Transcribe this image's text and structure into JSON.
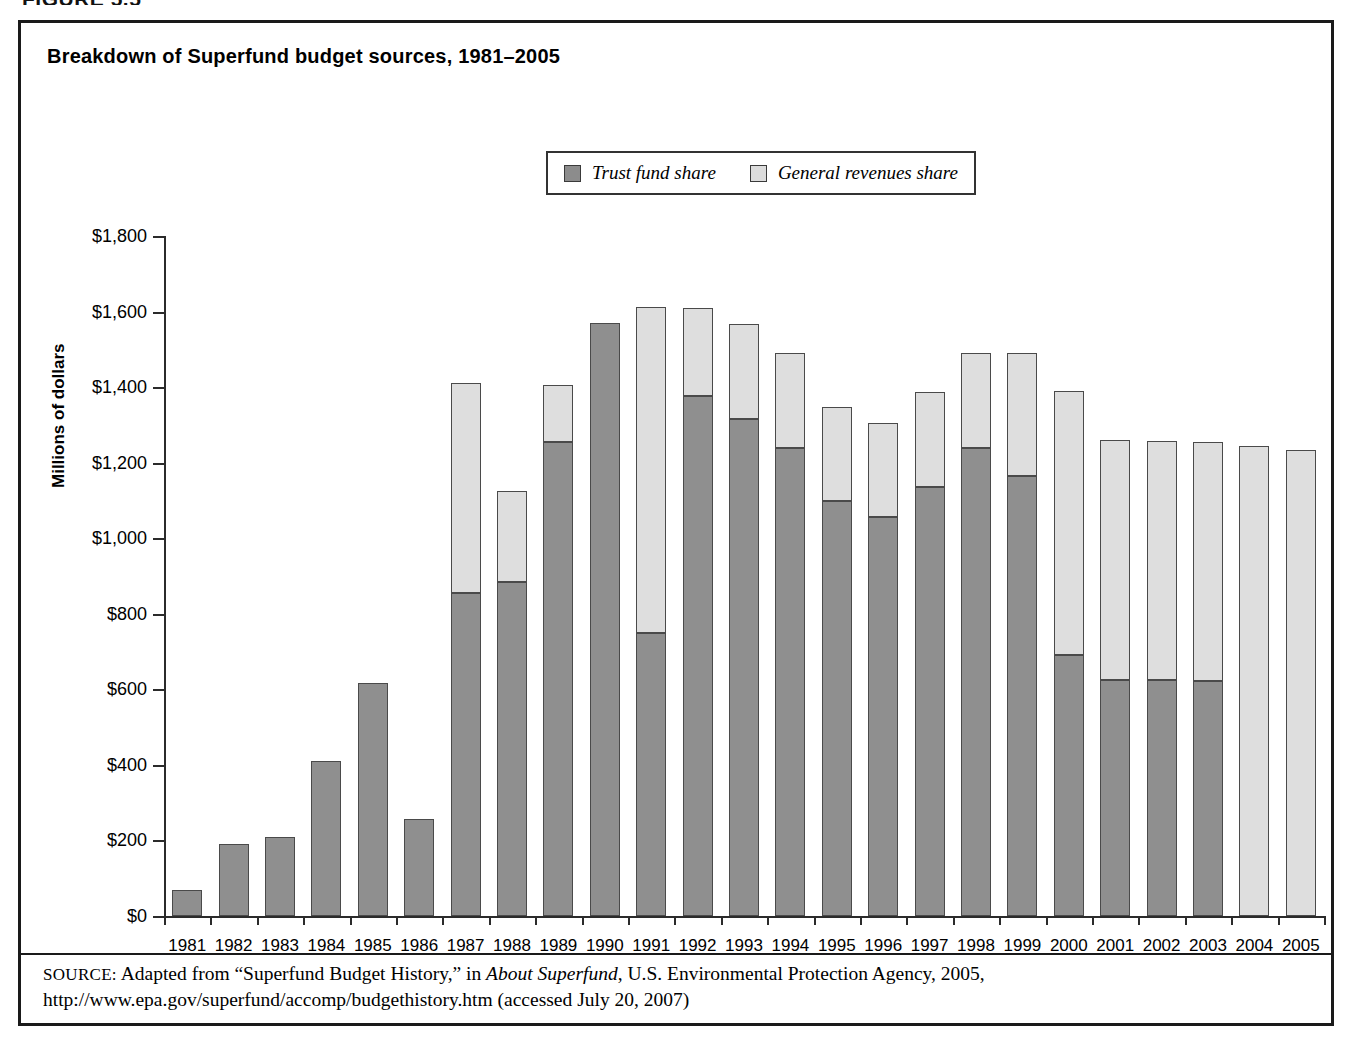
{
  "figure": {
    "caption": "FIGURE 5.5"
  },
  "chart_title": "Breakdown of Superfund budget sources, 1981–2005",
  "legend": {
    "position": "top-center",
    "items": [
      {
        "label": "Trust fund share",
        "color": "#8f8f8f",
        "icon": "legend-swatch"
      },
      {
        "label": "General revenues share",
        "color": "#dedede",
        "icon": "legend-swatch"
      }
    ]
  },
  "source_note": {
    "prefix": "SOURCE:",
    "text_1": " Adapted from “Superfund Budget History,” in ",
    "italic_1": "About Superfund",
    "text_2": ", U.S. Environmental Protection Agency, 2005, http://www.epa.gov/superfund/accomp/budgethistory.htm (accessed July 20, 2007)"
  },
  "chart_data": {
    "type": "bar",
    "subtype": "stacked-vertical",
    "title": "Breakdown of Superfund budget sources, 1981–2005",
    "xlabel": "",
    "ylabel": "Millions of dollars",
    "ylim": [
      0,
      1800
    ],
    "ytick_step": 200,
    "ytick_labels": [
      "$0",
      "$200",
      "$400",
      "$600",
      "$800",
      "$1,000",
      "$1,200",
      "$1,400",
      "$1,600",
      "$1,800"
    ],
    "ytick_values": [
      0,
      200,
      400,
      600,
      800,
      1000,
      1200,
      1400,
      1600,
      1800
    ],
    "grid": false,
    "categories": [
      "1981",
      "1982",
      "1983",
      "1984",
      "1985",
      "1986",
      "1987",
      "1988",
      "1989",
      "1990",
      "1991",
      "1992",
      "1993",
      "1994",
      "1995",
      "1996",
      "1997",
      "1998",
      "1999",
      "2000",
      "2001",
      "2002",
      "2003",
      "2004",
      "2005"
    ],
    "series": [
      {
        "name": "Trust fund share",
        "color": "#8f8f8f",
        "values": [
          68,
          190,
          208,
          410,
          617,
          258,
          855,
          883,
          1254,
          1570,
          750,
          1376,
          1316,
          1239,
          1098,
          1055,
          1136,
          1239,
          1165,
          690,
          626,
          624,
          622,
          0,
          0
        ]
      },
      {
        "name": "General revenues share",
        "color": "#dedede",
        "values": [
          0,
          0,
          0,
          0,
          0,
          0,
          555,
          241,
          152,
          0,
          862,
          234,
          252,
          251,
          250,
          250,
          250,
          251,
          325,
          699,
          633,
          634,
          632,
          1245,
          1233
        ]
      }
    ],
    "totals": [
      68,
      190,
      208,
      410,
      617,
      258,
      1410,
      1124,
      1406,
      1570,
      1612,
      1610,
      1568,
      1490,
      1348,
      1305,
      1386,
      1490,
      1490,
      1389,
      1259,
      1258,
      1254,
      1245,
      1233
    ]
  }
}
